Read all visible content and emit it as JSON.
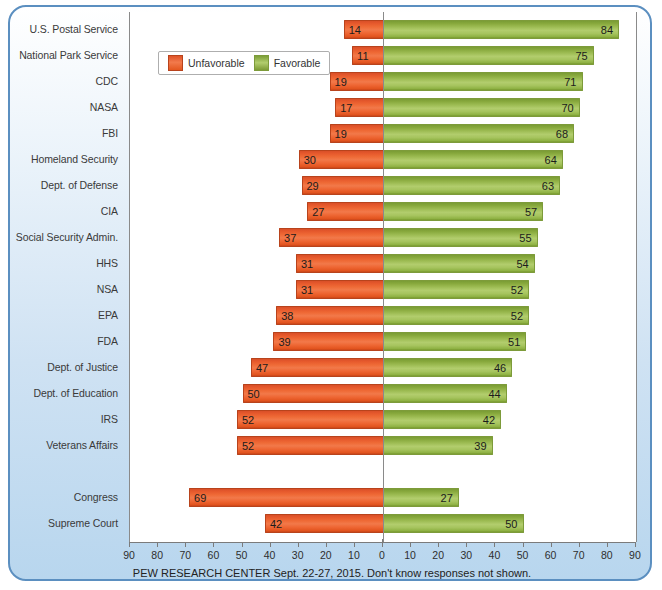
{
  "chart_data": {
    "type": "bar",
    "title": "",
    "subtitle": "",
    "orientation": "horizontal",
    "layout": "diverging",
    "xlabel": "",
    "ylabel": "",
    "xlim": [
      -90,
      90
    ],
    "axis_ticks": [
      "90",
      "80",
      "70",
      "60",
      "50",
      "40",
      "30",
      "20",
      "10",
      "0",
      "10",
      "20",
      "30",
      "40",
      "50",
      "60",
      "70",
      "80",
      "90"
    ],
    "axis_tick_values": [
      -90,
      -80,
      -70,
      -60,
      -50,
      -40,
      -30,
      -20,
      -10,
      0,
      10,
      20,
      30,
      40,
      50,
      60,
      70,
      80,
      90
    ],
    "grid": false,
    "legend_position": "top-left-inside",
    "legend": [
      "Unfavorable",
      "Favorable"
    ],
    "colors": {
      "unfavorable": "#e9602e",
      "favorable": "#9cbb52",
      "frame": "#5b8fc0",
      "plot_background": "#ffffff",
      "axis": "#7b7b7b"
    },
    "categories": [
      "U.S. Postal Service",
      "National Park Service",
      "CDC",
      "NASA",
      "FBI",
      "Homeland Security",
      "Dept. of Defense",
      "CIA",
      "Social Security Admin.",
      "HHS",
      "NSA",
      "EPA",
      "FDA",
      "Dept. of Justice",
      "Dept. of Education",
      "IRS",
      "Veterans Affairs",
      "",
      "Congress",
      "Supreme Court"
    ],
    "series": [
      {
        "name": "Unfavorable",
        "values": [
          14,
          11,
          19,
          17,
          19,
          30,
          29,
          27,
          37,
          31,
          31,
          38,
          39,
          47,
          50,
          52,
          52,
          null,
          69,
          42
        ]
      },
      {
        "name": "Favorable",
        "values": [
          84,
          75,
          71,
          70,
          68,
          64,
          63,
          57,
          55,
          54,
          52,
          52,
          51,
          46,
          44,
          42,
          39,
          null,
          27,
          50
        ]
      }
    ],
    "rows": [
      {
        "label": "U.S. Postal Service",
        "unfavorable": 14,
        "favorable": 84
      },
      {
        "label": "National Park Service",
        "unfavorable": 11,
        "favorable": 75
      },
      {
        "label": "CDC",
        "unfavorable": 19,
        "favorable": 71
      },
      {
        "label": "NASA",
        "unfavorable": 17,
        "favorable": 70
      },
      {
        "label": "FBI",
        "unfavorable": 19,
        "favorable": 68
      },
      {
        "label": "Homeland Security",
        "unfavorable": 30,
        "favorable": 64
      },
      {
        "label": "Dept. of Defense",
        "unfavorable": 29,
        "favorable": 63
      },
      {
        "label": "CIA",
        "unfavorable": 27,
        "favorable": 57
      },
      {
        "label": "Social Security Admin.",
        "unfavorable": 37,
        "favorable": 55
      },
      {
        "label": "HHS",
        "unfavorable": 31,
        "favorable": 54
      },
      {
        "label": "NSA",
        "unfavorable": 31,
        "favorable": 52
      },
      {
        "label": "EPA",
        "unfavorable": 38,
        "favorable": 52
      },
      {
        "label": "FDA",
        "unfavorable": 39,
        "favorable": 51
      },
      {
        "label": "Dept. of Justice",
        "unfavorable": 47,
        "favorable": 46
      },
      {
        "label": "Dept. of Education",
        "unfavorable": 50,
        "favorable": 44
      },
      {
        "label": "IRS",
        "unfavorable": 52,
        "favorable": 42
      },
      {
        "label": "Veterans Affairs",
        "unfavorable": 52,
        "favorable": 39
      },
      {
        "label": "",
        "unfavorable": null,
        "favorable": null
      },
      {
        "label": "Congress",
        "unfavorable": 69,
        "favorable": 27
      },
      {
        "label": "Supreme Court",
        "unfavorable": 42,
        "favorable": 50
      }
    ]
  },
  "legend": {
    "unfavorable_label": "Unfavorable",
    "favorable_label": "Favorable"
  },
  "footer": {
    "source_note": "PEW RESEARCH CENTER Sept. 22-27, 2015. Don't know responses not shown."
  }
}
